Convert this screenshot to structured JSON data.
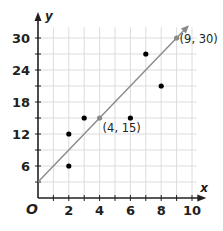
{
  "chart_data": {
    "type": "scatter",
    "title": "",
    "xlabel": "x",
    "ylabel": "y",
    "origin_label": "O",
    "xlim": [
      0,
      10
    ],
    "ylim": [
      0,
      30
    ],
    "x_ticks": [
      2,
      4,
      6,
      8,
      10
    ],
    "y_ticks": [
      6,
      12,
      18,
      24,
      30
    ],
    "x_grid_step": 1,
    "y_grid_step": 3,
    "grid": true,
    "series": [
      {
        "name": "data points",
        "type": "scatter",
        "color": "#000000",
        "points": [
          [
            2,
            6
          ],
          [
            2,
            12
          ],
          [
            3,
            15
          ],
          [
            6,
            15
          ],
          [
            7,
            27
          ],
          [
            8,
            21
          ]
        ]
      },
      {
        "name": "trend line",
        "type": "line",
        "color": "#8a8a8a",
        "from": [
          0,
          3
        ],
        "to": [
          9.8,
          32.4
        ],
        "equation": "y = 3x + 3"
      },
      {
        "name": "labeled points",
        "type": "scatter",
        "color": "#8a8a8a",
        "points": [
          [
            4,
            15
          ],
          [
            9,
            30
          ]
        ]
      }
    ],
    "annotations": [
      {
        "text": "(4, 15)",
        "x": 4,
        "y": 15
      },
      {
        "text": "(9, 30)",
        "x": 9,
        "y": 30
      }
    ]
  }
}
